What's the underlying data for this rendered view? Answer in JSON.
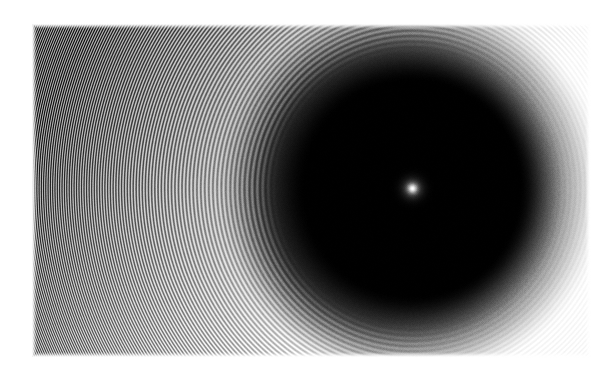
{
  "figure": {
    "kind": "interferogram-photograph",
    "title": "Concentric interference fringe pattern with central bright spot",
    "medium": "grayscale photographic plate scan",
    "caption": ""
  },
  "canvas": {
    "width": 612,
    "height": 381,
    "page_background": "#ffffff"
  },
  "plate": {
    "x": 31,
    "y": 23,
    "width": 559,
    "height": 334,
    "corner_softness": 2,
    "base_tone": "#f2f2f2",
    "edge_fade": 6
  },
  "pattern_center": {
    "x": 412,
    "y": 188,
    "label": "central bright spot",
    "core_radius": 4,
    "core_color": "#ffffff",
    "halo_radius": 11,
    "halo_color": "#5a5a5a"
  },
  "dark_disk": {
    "center_x": 412,
    "center_y": 188,
    "radius": 133,
    "core_color": "#000000",
    "edge_color": "#0a0a0a",
    "falloff_start": 0.8,
    "falloff_end": 1.18,
    "notes": "large saturated opaque disk surrounding the centre"
  },
  "halo": {
    "inner_radius": 133,
    "outer_radius": 200,
    "inner_color": "#2a2a2a",
    "outer_color": "#fafafa"
  },
  "fringes": {
    "type": "concentric-circular",
    "count": 46,
    "first_radius": 138,
    "spacing_model": "sqrt",
    "spacing_constant": 1660,
    "max_radius": 560,
    "light_tone": "#fbfbfb",
    "dark_tone": "#5f5f5f",
    "contrast_falloff": "increases outward toward upper-left",
    "notes": "ring spacing narrows with distance from centre, as sqrt(n)"
  },
  "vignette": {
    "darkest_corner": "upper-left",
    "corner_tone": "#3b3b3b",
    "bright_region": "right",
    "bright_tone": "#fdfdfd"
  },
  "grain": {
    "enabled": true,
    "amplitude": 14,
    "seed": 20250607,
    "description": "photographic film grain / halftone screen texture"
  },
  "colors": {
    "black": "#000000",
    "white": "#ffffff",
    "mid_gray": "#808080",
    "plate_light": "#f2f2f2",
    "plate_dark": "#303030"
  },
  "scale_markers": [],
  "annotations": [],
  "axis_labels": []
}
